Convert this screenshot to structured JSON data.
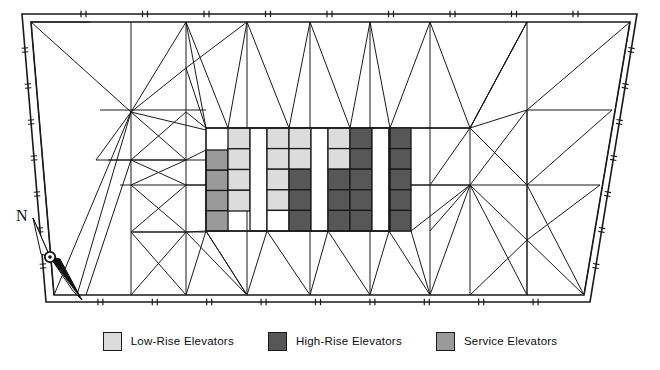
{
  "plan": {
    "title": "Elevator Core Floor Plan",
    "colors": {
      "low_rise": "#dcdcdc",
      "high_rise": "#575757",
      "service": "#9a9a9a",
      "corridor": "#ffffff",
      "line": "#1a1a1a",
      "background": "#ffffff"
    },
    "outline": {
      "name": "building-perimeter",
      "shape": "trapezoid",
      "outer_points": "22,14 637,14 590,302 46,302",
      "inner_points": "31,22 630,22 584,295 54,295"
    },
    "core": {
      "name": "elevator-core",
      "x": 206,
      "y": 128,
      "width": 184,
      "height": 103,
      "row_count": 5,
      "columns": [
        {
          "id": "service-west",
          "x": 206,
          "width": 22,
          "y": 150,
          "height": 81,
          "type": "service",
          "rows": [
            "service",
            "service",
            "service",
            "service"
          ]
        },
        {
          "id": "low-rise-a",
          "x": 228,
          "width": 22,
          "y": 128,
          "height": 83,
          "type": "low_rise",
          "rows": [
            "low_rise",
            "low_rise",
            "low_rise",
            "low_rise"
          ]
        },
        {
          "id": "corridor-1",
          "x": 250,
          "width": 17,
          "y": 128,
          "height": 103,
          "type": "corridor",
          "rows": []
        },
        {
          "id": "low-rise-b",
          "x": 267,
          "width": 22,
          "y": 128,
          "height": 103,
          "type": "low_rise",
          "rows": [
            "low_rise",
            "low_rise",
            "low_rise",
            "low_rise",
            "corridor"
          ]
        },
        {
          "id": "mixed-c",
          "x": 289,
          "width": 22,
          "y": 128,
          "height": 103,
          "type": "mixed",
          "rows": [
            "low_rise",
            "low_rise",
            "high_rise",
            "high_rise",
            "high_rise"
          ]
        },
        {
          "id": "corridor-2",
          "x": 311,
          "width": 17,
          "y": 128,
          "height": 103,
          "type": "corridor",
          "rows": []
        },
        {
          "id": "mixed-d",
          "x": 328,
          "width": 22,
          "y": 128,
          "height": 103,
          "type": "mixed",
          "rows": [
            "low_rise",
            "low_rise",
            "high_rise",
            "high_rise",
            "high_rise"
          ]
        },
        {
          "id": "high-rise-a",
          "x": 350,
          "width": 22,
          "y": 128,
          "height": 103,
          "type": "high_rise",
          "rows": [
            "high_rise",
            "high_rise",
            "high_rise",
            "high_rise",
            "high_rise"
          ]
        },
        {
          "id": "corridor-3",
          "x": 372,
          "width": 17,
          "y": 128,
          "height": 103,
          "type": "corridor",
          "rows": []
        },
        {
          "id": "high-rise-b",
          "x": 389,
          "width": 22,
          "y": 128,
          "height": 103,
          "type": "high_rise",
          "rows": [
            "high_rise",
            "high_rise",
            "high_rise",
            "high_rise",
            "high_rise"
          ]
        }
      ]
    },
    "compass": {
      "name": "north-arrow",
      "label": "N",
      "label_x": 16,
      "label_y": 218,
      "pivot_x": 50,
      "pivot_y": 257
    }
  },
  "legend": {
    "name": "plan-legend",
    "items": [
      {
        "label": "Low-Rise Elevators",
        "swatch": "#dcdcdc",
        "key": "low_rise"
      },
      {
        "label": "High-Rise Elevators",
        "swatch": "#575757",
        "key": "high_rise"
      },
      {
        "label": "Service Elevators",
        "swatch": "#9a9a9a",
        "key": "service"
      }
    ]
  }
}
